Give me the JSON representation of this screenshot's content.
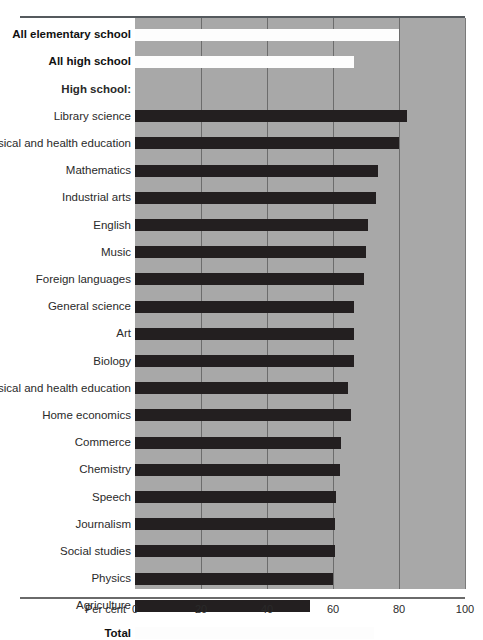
{
  "chart_data": {
    "type": "bar",
    "orientation": "horizontal",
    "title": "",
    "subtitle": "",
    "xlabel": "Per cent",
    "ylabel": "",
    "xlim": [
      0,
      100
    ],
    "xticks": [
      0,
      20,
      40,
      60,
      80,
      100
    ],
    "xtick_labels": [
      "0",
      "20",
      "40",
      "60",
      "80",
      "100"
    ],
    "grid": true,
    "grid_axis": "x",
    "legend": "none",
    "bar_colors": {
      "dark": "#231f20",
      "light": "#fdfdfd"
    },
    "panel_color": "#a8a8a8",
    "groups": [
      {
        "name": "",
        "is_header": false,
        "rows": [
          {
            "label": "All elementary school",
            "value": 80.0,
            "style": "light",
            "bold": true
          },
          {
            "label": "All high school",
            "value": 66.5,
            "style": "light",
            "bold": true
          }
        ]
      },
      {
        "name": "High school:",
        "is_header": true,
        "rows": [
          {
            "label": "Library science",
            "value": 82.5,
            "style": "dark",
            "bold": false
          },
          {
            "label": "Women's physical and health education",
            "value": 80.0,
            "style": "dark",
            "bold": false
          },
          {
            "label": "Mathematics",
            "value": 73.5,
            "style": "dark",
            "bold": false
          },
          {
            "label": "Industrial arts",
            "value": 73.0,
            "style": "dark",
            "bold": false
          },
          {
            "label": "English",
            "value": 70.5,
            "style": "dark",
            "bold": false
          },
          {
            "label": "Music",
            "value": 70.0,
            "style": "dark",
            "bold": false
          },
          {
            "label": "Foreign languages",
            "value": 69.5,
            "style": "dark",
            "bold": false
          },
          {
            "label": "General science",
            "value": 66.5,
            "style": "dark",
            "bold": false
          },
          {
            "label": "Art",
            "value": 66.5,
            "style": "dark",
            "bold": false
          },
          {
            "label": "Biology",
            "value": 66.5,
            "style": "dark",
            "bold": false
          },
          {
            "label": "Men's physical and health education",
            "value": 64.5,
            "style": "dark",
            "bold": false
          },
          {
            "label": "Home economics",
            "value": 65.5,
            "style": "dark",
            "bold": false
          },
          {
            "label": "Commerce",
            "value": 62.5,
            "style": "dark",
            "bold": false
          },
          {
            "label": "Chemistry",
            "value": 62.0,
            "style": "dark",
            "bold": false
          },
          {
            "label": "Speech",
            "value": 61.0,
            "style": "dark",
            "bold": false
          },
          {
            "label": "Journalism",
            "value": 60.5,
            "style": "dark",
            "bold": false
          },
          {
            "label": "Social studies",
            "value": 60.5,
            "style": "dark",
            "bold": false
          },
          {
            "label": "Physics",
            "value": 60.0,
            "style": "dark",
            "bold": false
          },
          {
            "label": "Agriculture",
            "value": 53.0,
            "style": "dark",
            "bold": false
          }
        ]
      },
      {
        "name": "",
        "is_header": false,
        "rows": [
          {
            "label": "Total",
            "value": 72.5,
            "style": "light",
            "bold": true
          }
        ]
      }
    ]
  }
}
